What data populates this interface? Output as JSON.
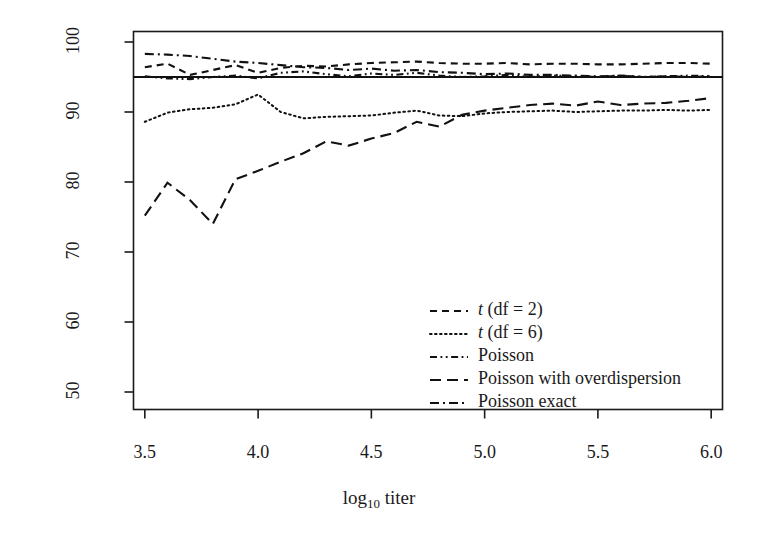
{
  "chart_data": {
    "type": "line",
    "title": "",
    "xlabel": "log10 titer",
    "xlabel_base": "log",
    "xlabel_sub": "10",
    "xlabel_rest": "titer",
    "ylabel": "Coverage (%)",
    "xlim": [
      3.45,
      6.05
    ],
    "ylim": [
      47.5,
      101.5
    ],
    "xticks": [
      3.5,
      4.0,
      4.5,
      5.0,
      5.5,
      6.0
    ],
    "xtick_labels": [
      "3.5",
      "4.0",
      "4.5",
      "5.0",
      "5.5",
      "6.0"
    ],
    "yticks": [
      50,
      60,
      70,
      80,
      90,
      100
    ],
    "ytick_labels": [
      "50",
      "60",
      "70",
      "80",
      "90",
      "100"
    ],
    "grid": false,
    "legend_position": "center",
    "reference_line": {
      "y": 95,
      "style": "solid",
      "label": "95% nominal coverage"
    },
    "x": [
      3.5,
      3.6,
      3.7,
      3.8,
      3.9,
      4.0,
      4.1,
      4.2,
      4.3,
      4.4,
      4.5,
      4.6,
      4.7,
      4.8,
      4.9,
      5.0,
      5.1,
      5.2,
      5.3,
      5.4,
      5.5,
      5.6,
      5.7,
      5.8,
      5.9,
      6.0
    ],
    "series": [
      {
        "name": "t (df = 2)",
        "name_italic_prefix": "t",
        "name_rest": " (df = 2)",
        "style": "dashed",
        "values": [
          96.4,
          96.9,
          95.3,
          96.0,
          96.7,
          95.6,
          96.3,
          96.6,
          96.5,
          96.8,
          97.0,
          97.1,
          97.2,
          97.0,
          96.9,
          96.9,
          97.0,
          96.8,
          96.9,
          96.9,
          96.8,
          96.8,
          96.9,
          97.0,
          97.0,
          96.9
        ]
      },
      {
        "name": "t (df = 6)",
        "name_italic_prefix": "t",
        "name_rest": " (df = 6)",
        "style": "dotted",
        "values": [
          88.6,
          89.9,
          90.4,
          90.6,
          91.1,
          92.5,
          90.0,
          89.1,
          89.3,
          89.4,
          89.5,
          89.9,
          90.2,
          89.5,
          89.4,
          89.8,
          90.0,
          90.1,
          90.2,
          90.0,
          90.1,
          90.2,
          90.2,
          90.3,
          90.2,
          90.3
        ]
      },
      {
        "name": "Poisson",
        "style": "dash-dot-dot",
        "values": [
          95.1,
          94.8,
          94.7,
          95.0,
          95.2,
          94.8,
          95.6,
          95.8,
          95.4,
          95.1,
          95.5,
          95.3,
          95.6,
          95.2,
          95.0,
          95.1,
          95.3,
          95.0,
          95.2,
          95.1,
          95.0,
          95.2,
          95.0,
          95.1,
          95.2,
          95.1
        ]
      },
      {
        "name": "Poisson with overdispersion",
        "style": "long-dashed",
        "values": [
          75.2,
          79.9,
          77.4,
          74.0,
          80.4,
          81.6,
          82.9,
          84.1,
          85.8,
          85.2,
          86.2,
          87.0,
          88.6,
          87.9,
          89.6,
          90.2,
          90.6,
          91.0,
          91.2,
          90.9,
          91.5,
          91.0,
          91.2,
          91.3,
          91.6,
          92.0
        ]
      },
      {
        "name": "Poisson exact",
        "style": "dash-dot",
        "values": [
          98.3,
          98.2,
          98.0,
          97.6,
          97.2,
          97.0,
          96.7,
          96.4,
          96.3,
          96.0,
          96.2,
          95.9,
          96.0,
          95.7,
          95.6,
          95.4,
          95.5,
          95.3,
          95.3,
          95.2,
          95.1,
          95.2,
          95.0,
          95.1,
          95.0,
          95.1
        ]
      }
    ]
  },
  "legend": {
    "entries": [
      {
        "label_italic": "t",
        "label_rest": " (df = 2)",
        "style": "dashed"
      },
      {
        "label_italic": "t",
        "label_rest": " (df = 6)",
        "style": "dotted"
      },
      {
        "label_italic": "",
        "label_rest": "Poisson",
        "style": "dash-dot-dot"
      },
      {
        "label_italic": "",
        "label_rest": "Poisson with overdispersion",
        "style": "long-dashed"
      },
      {
        "label_italic": "",
        "label_rest": "Poisson exact",
        "style": "dash-dot"
      }
    ]
  },
  "colors": {
    "line": "#111111",
    "axis": "#1a1a1a",
    "background": "#ffffff"
  }
}
